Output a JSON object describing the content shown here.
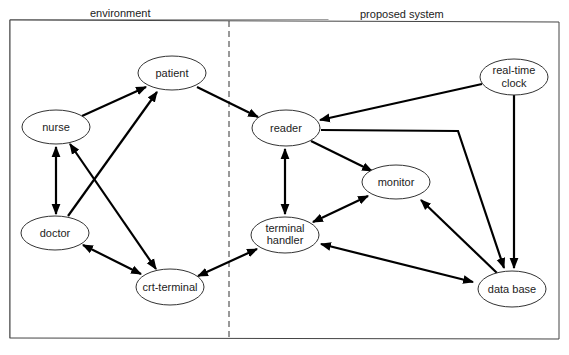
{
  "regions": {
    "environment": {
      "title": "environment"
    },
    "proposed_system": {
      "title": "proposed system"
    }
  },
  "nodes": {
    "patient": {
      "label": "patient"
    },
    "nurse": {
      "label": "nurse"
    },
    "doctor": {
      "label": "doctor"
    },
    "crt_terminal": {
      "label": "crt-terminal"
    },
    "reader": {
      "label": "reader"
    },
    "monitor": {
      "label": "monitor"
    },
    "terminal_handler": {
      "line1": "terminal",
      "line2": "handler"
    },
    "real_time_clock": {
      "line1": "real-time",
      "line2": "clock"
    },
    "data_base": {
      "label": "data base"
    }
  },
  "edges": [
    {
      "from": "nurse",
      "to": "patient",
      "direction": "forward"
    },
    {
      "from": "doctor",
      "to": "patient",
      "direction": "forward"
    },
    {
      "from": "patient",
      "to": "reader",
      "direction": "forward"
    },
    {
      "from": "nurse",
      "to": "doctor",
      "direction": "both"
    },
    {
      "from": "nurse",
      "to": "crt-terminal",
      "direction": "both"
    },
    {
      "from": "doctor",
      "to": "crt-terminal",
      "direction": "both"
    },
    {
      "from": "crt-terminal",
      "to": "terminal handler",
      "direction": "both"
    },
    {
      "from": "real-time clock",
      "to": "reader",
      "direction": "forward"
    },
    {
      "from": "real-time clock",
      "to": "data base",
      "direction": "forward"
    },
    {
      "from": "reader",
      "to": "data base",
      "direction": "forward"
    },
    {
      "from": "reader",
      "to": "monitor",
      "direction": "forward"
    },
    {
      "from": "reader",
      "to": "terminal handler",
      "direction": "both"
    },
    {
      "from": "monitor",
      "to": "terminal handler",
      "direction": "both"
    },
    {
      "from": "data base",
      "to": "monitor",
      "direction": "forward"
    },
    {
      "from": "terminal handler",
      "to": "data base",
      "direction": "both"
    }
  ]
}
